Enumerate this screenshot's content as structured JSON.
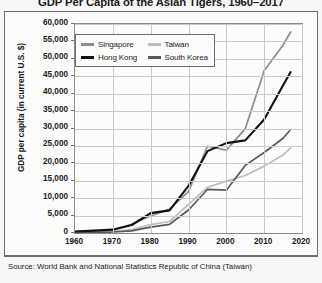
{
  "title": "GDP Per Capita of the Asian Tigers, 1960–2017",
  "source": "Source: World Bank and National Statistics Republic of China (Taiwan)",
  "legend": {
    "items": [
      {
        "label": "Singapore",
        "color": "#8c8c8c"
      },
      {
        "label": "Taiwan",
        "color": "#bdbdbd"
      },
      {
        "label": "Hong Kong",
        "color": "#111111"
      },
      {
        "label": "South Korea",
        "color": "#595959"
      }
    ]
  },
  "chart_data": {
    "type": "line",
    "title": "GDP Per Capita of the Asian Tigers, 1960–2017",
    "xlabel": "",
    "ylabel": "GDP per capita (in current U.S. $)",
    "xlim": [
      1960,
      2020
    ],
    "ylim": [
      0,
      60000
    ],
    "xticks": [
      "1960",
      "1970",
      "1980",
      "1990",
      "2000",
      "2010",
      "2020"
    ],
    "yticks": [
      "0",
      "5,000",
      "10,000",
      "15,000",
      "20,000",
      "25,000",
      "30,000",
      "35,000",
      "40,000",
      "45,000",
      "50,000",
      "55,000",
      "60,000"
    ],
    "grid": true,
    "legend_position": "top-left-inside",
    "x": [
      1960,
      1965,
      1970,
      1975,
      1980,
      1985,
      1990,
      1995,
      2000,
      2005,
      2010,
      2015,
      2017
    ],
    "series": [
      {
        "name": "Singapore",
        "color": "#8c8c8c",
        "values": [
          430,
          550,
          920,
          2500,
          4900,
          6900,
          11900,
          24900,
          23800,
          29900,
          46600,
          54000,
          57700
        ]
      },
      {
        "name": "Hong Kong",
        "color": "#111111",
        "values": [
          430,
          680,
          960,
          2300,
          5700,
          6500,
          13500,
          23500,
          25800,
          26600,
          32600,
          42400,
          46200
        ]
      },
      {
        "name": "South Korea",
        "color": "#595959",
        "values": [
          160,
          110,
          280,
          620,
          1700,
          2500,
          6600,
          12500,
          12300,
          19400,
          23100,
          27200,
          29700
        ]
      },
      {
        "name": "Taiwan",
        "color": "#bdbdbd",
        "values": [
          160,
          230,
          400,
          980,
          2400,
          3300,
          8200,
          13100,
          14900,
          16500,
          19200,
          22400,
          24400
        ]
      }
    ]
  }
}
